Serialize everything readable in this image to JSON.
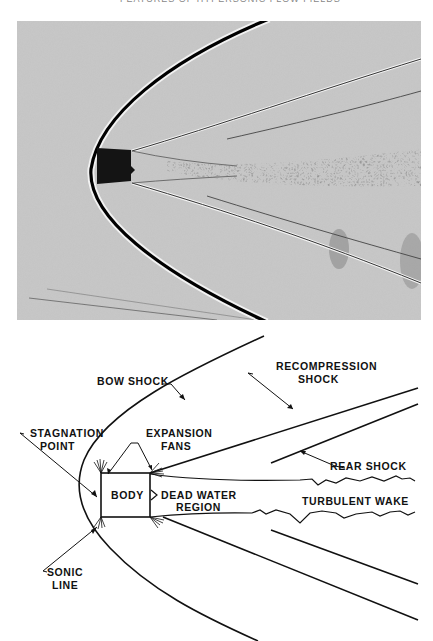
{
  "page": {
    "header_text": "FEATURES OF HYPERSONIC FLOW FIELDS",
    "figure_type": "shadowgraph photograph with explanatory sketch"
  },
  "photo": {
    "description": "Shadowgraph of blunt cylindrical body in hypersonic flow showing bow shock, expansion fans, recompression shocks and turbulent wake",
    "background_color": "#c8c8c8",
    "body_color": "#141414"
  },
  "diagram": {
    "labels": {
      "bow_shock": "BOW SHOCK",
      "recompression_shock_1": "RECOMPRESSION",
      "recompression_shock_2": "SHOCK",
      "stagnation_point_1": "STAGNATION",
      "stagnation_point_2": "POINT",
      "expansion_fans_1": "EXPANSION",
      "expansion_fans_2": "FANS",
      "body": "BODY",
      "dead_water_1": "DEAD WATER",
      "dead_water_2": "REGION",
      "rear_shock": "REAR SHOCK",
      "turbulent_wake": "TURBULENT WAKE",
      "sonic_line_1": "SONIC",
      "sonic_line_2": "LINE"
    }
  }
}
